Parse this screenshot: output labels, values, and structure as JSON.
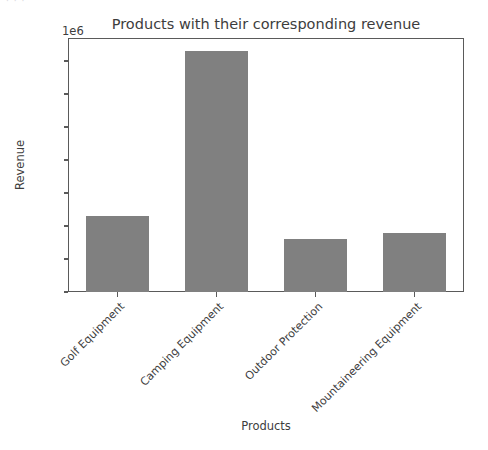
{
  "artifact": {
    "ghost_text": "·  ·    ·"
  },
  "chart_data": {
    "type": "bar",
    "title": "Products with their corresponding revenue",
    "xlabel": "Products",
    "ylabel": "Revenue",
    "categories": [
      "Golf Equipment",
      "Camping Equipment",
      "Outdoor Protection",
      "Mountaineering Equipment"
    ],
    "values": [
      1150000,
      3650000,
      800000,
      890000
    ],
    "ylim": [
      0,
      3850000
    ],
    "y_offset_text": "1e6",
    "y_offset_multiplier": 1000000,
    "yticks": [
      0,
      500000,
      1000000,
      1500000,
      2000000,
      2500000,
      3000000,
      3500000
    ],
    "ytick_labels": [
      "0.0",
      "0.5",
      "1.0",
      "1.5",
      "2.0",
      "2.5",
      "3.0",
      "3.5"
    ],
    "grid": false,
    "legend": null,
    "bar_color": "#808080",
    "axis_color": "#5a5a5a",
    "text_color": "#3d3d3d",
    "xtick_rotation": 45
  }
}
